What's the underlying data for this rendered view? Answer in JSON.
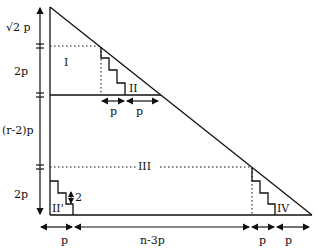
{
  "diagram": {
    "type": "geometric-decomposition",
    "line_color": "#111111",
    "background": "#ffffff",
    "left_axis_labels": {
      "top": "√2 p",
      "upper": "2p",
      "middle": "(r-2)p",
      "lower": "2p"
    },
    "region_labels": {
      "I": "I",
      "II": "II",
      "III": "III",
      "IV": "IV",
      "II_prime": "II'",
      "step_height": "2"
    },
    "upper_dim_labels": [
      "p",
      "p"
    ],
    "bottom_axis_labels": [
      "p",
      "n-3p",
      "p",
      "p"
    ]
  }
}
